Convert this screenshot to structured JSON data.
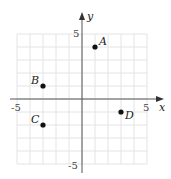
{
  "chart_data": {
    "type": "scatter",
    "title": "",
    "xlabel": "x",
    "ylabel": "y",
    "xlim": [
      -5,
      5
    ],
    "ylim": [
      -5,
      5
    ],
    "grid": true,
    "tick_labels": {
      "x": [
        "-5",
        "5"
      ],
      "y": [
        "5",
        "-5"
      ]
    },
    "points": [
      {
        "label": "A",
        "x": 1,
        "y": 4
      },
      {
        "label": "B",
        "x": -3,
        "y": 1
      },
      {
        "label": "C",
        "x": -3,
        "y": -2
      },
      {
        "label": "D",
        "x": 3,
        "y": -1
      }
    ]
  },
  "colors": {
    "grid": "#e4e4e4",
    "axis": "#555555",
    "point": "#111111"
  }
}
